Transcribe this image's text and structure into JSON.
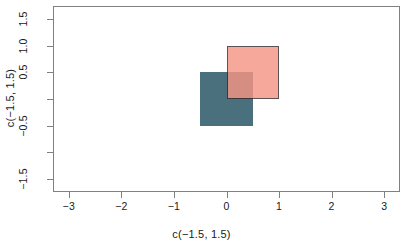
{
  "chart_data": {
    "type": "scatter",
    "title": "",
    "xlabel": "c(−1.5, 1.5)",
    "ylabel": "c(−1.5, 1.5)",
    "xlim": [
      -3.3,
      3.3
    ],
    "ylim": [
      -1.75,
      1.75
    ],
    "grid": false,
    "legend": "none",
    "x_ticks": [
      {
        "value": -3,
        "label": "−3"
      },
      {
        "value": -2,
        "label": "−2"
      },
      {
        "value": -1,
        "label": "−1"
      },
      {
        "value": 0,
        "label": "0"
      },
      {
        "value": 1,
        "label": "1"
      },
      {
        "value": 2,
        "label": "2"
      },
      {
        "value": 3,
        "label": "3"
      }
    ],
    "y_ticks": [
      {
        "value": 1.5,
        "label": "1.5"
      },
      {
        "value": 1.0,
        "label": "1.0"
      },
      {
        "value": 0.5,
        "label": "0.5"
      },
      {
        "value": 0.0,
        "label": ""
      },
      {
        "value": -0.5,
        "label": "−0.5"
      },
      {
        "value": -1.0,
        "label": ""
      },
      {
        "value": -1.5,
        "label": "−1.5"
      }
    ],
    "shapes": [
      {
        "name": "teal-square",
        "type": "rect",
        "xmin": -0.5,
        "xmax": 0.5,
        "ymin": -0.5,
        "ymax": 0.5,
        "fill": "#4a707d",
        "border": "none",
        "z": 1
      },
      {
        "name": "salmon-square",
        "type": "rect",
        "xmin": 0.0,
        "xmax": 1.0,
        "ymin": 0.0,
        "ymax": 1.0,
        "fill": "#f59585",
        "border": "#3a2b2b",
        "opacity": 0.82,
        "z": 2
      }
    ],
    "overlap_color": "#b08080"
  },
  "axes": {
    "x_title": "c(−1.5, 1.5)",
    "y_title": "c(−1.5, 1.5)"
  }
}
